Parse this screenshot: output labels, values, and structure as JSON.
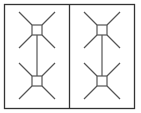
{
  "diagram": {
    "width": 141,
    "height": 113,
    "frame": {
      "x": 4.5,
      "y": 4.5,
      "w": 130,
      "h": 104,
      "stroke": "#333333",
      "stroke_width": 1.3
    },
    "divider": {
      "x": 69.5
    },
    "line_color": "#555555",
    "panels": [
      {
        "id": "left",
        "connector": {
          "x": 37,
          "y1": 35,
          "y2": 76
        },
        "nodes": [
          {
            "cx": 37,
            "cy": 30,
            "size": 10,
            "arm": 13
          },
          {
            "cx": 37,
            "cy": 81,
            "size": 10,
            "arm": 13
          }
        ]
      },
      {
        "id": "right",
        "connector": {
          "x": 102,
          "y1": 35,
          "y2": 76
        },
        "nodes": [
          {
            "cx": 102,
            "cy": 30,
            "size": 10,
            "arm": 13
          },
          {
            "cx": 102,
            "cy": 81,
            "size": 10,
            "arm": 13
          }
        ]
      }
    ]
  }
}
